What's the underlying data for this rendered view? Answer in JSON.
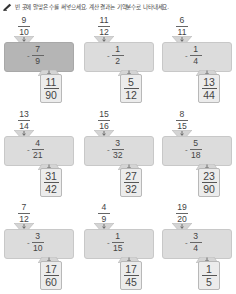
{
  "header": {
    "icon": "pencil-icon",
    "instruction": "빈 곳에 알맞은 수를 써넣으세요. 계산 결과는 기약분수로 나타내세요."
  },
  "colors": {
    "machine_example": "#b5b5b5",
    "machine": "#dcdcdc",
    "output_box": "#ececec"
  },
  "problems": [
    {
      "input": {
        "num": "9",
        "den": "10"
      },
      "operation": "-",
      "operand": {
        "num": "7",
        "den": "9"
      },
      "result": {
        "num": "11",
        "den": "90"
      },
      "example": true
    },
    {
      "input": {
        "num": "11",
        "den": "12"
      },
      "operation": "-",
      "operand": {
        "num": "1",
        "den": "2"
      },
      "result": {
        "num": "5",
        "den": "12"
      },
      "example": false
    },
    {
      "input": {
        "num": "6",
        "den": "11"
      },
      "operation": "-",
      "operand": {
        "num": "1",
        "den": "4"
      },
      "result": {
        "num": "13",
        "den": "44"
      },
      "example": false
    },
    {
      "input": {
        "num": "13",
        "den": "14"
      },
      "operation": "-",
      "operand": {
        "num": "4",
        "den": "21"
      },
      "result": {
        "num": "31",
        "den": "42"
      },
      "example": false
    },
    {
      "input": {
        "num": "15",
        "den": "16"
      },
      "operation": "-",
      "operand": {
        "num": "3",
        "den": "32"
      },
      "result": {
        "num": "27",
        "den": "32"
      },
      "example": false
    },
    {
      "input": {
        "num": "8",
        "den": "15"
      },
      "operation": "-",
      "operand": {
        "num": "5",
        "den": "18"
      },
      "result": {
        "num": "23",
        "den": "90"
      },
      "example": false
    },
    {
      "input": {
        "num": "7",
        "den": "12"
      },
      "operation": "-",
      "operand": {
        "num": "3",
        "den": "10"
      },
      "result": {
        "num": "17",
        "den": "60"
      },
      "example": false
    },
    {
      "input": {
        "num": "4",
        "den": "9"
      },
      "operation": "-",
      "operand": {
        "num": "1",
        "den": "15"
      },
      "result": {
        "num": "17",
        "den": "45"
      },
      "example": false
    },
    {
      "input": {
        "num": "19",
        "den": "20"
      },
      "operation": "-",
      "operand": {
        "num": "3",
        "den": "4"
      },
      "result": {
        "num": "1",
        "den": "5"
      },
      "example": false
    }
  ]
}
